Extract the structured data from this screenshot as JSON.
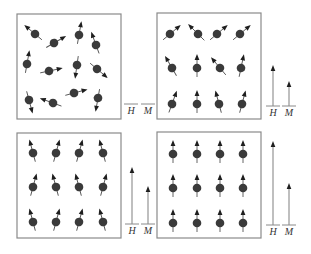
{
  "figure": {
    "colors": {
      "dot": "#3a3a3a",
      "border": "#8a8a8a",
      "arrowhead": "#1e1e1e"
    },
    "panels": [
      {
        "id": "panel-1",
        "box": {
          "x": 17,
          "y": 14,
          "w": 104,
          "h": 105
        },
        "spins": [
          {
            "x": 18,
            "y": 20,
            "angle": -50
          },
          {
            "x": 37,
            "y": 29,
            "angle": 60
          },
          {
            "x": 62,
            "y": 21,
            "angle": 10
          },
          {
            "x": 79,
            "y": 31,
            "angle": -20
          },
          {
            "x": 10,
            "y": 50,
            "angle": 10
          },
          {
            "x": 32,
            "y": 57,
            "angle": 78
          },
          {
            "x": 60,
            "y": 51,
            "angle": 188
          },
          {
            "x": 80,
            "y": 55,
            "angle": 130
          },
          {
            "x": 12,
            "y": 86,
            "angle": 165
          },
          {
            "x": 36,
            "y": 89,
            "angle": -70
          },
          {
            "x": 57,
            "y": 79,
            "angle": 75
          },
          {
            "x": 81,
            "y": 84,
            "angle": 190
          }
        ],
        "indicators": {
          "H": {
            "label": "H",
            "x": 131,
            "length": 0
          },
          "M": {
            "label": "M",
            "x": 148,
            "length": 0
          },
          "baseline_y": 104
        }
      },
      {
        "id": "panel-2",
        "box": {
          "x": 157,
          "y": 13,
          "w": 104,
          "h": 106
        },
        "spins": [
          {
            "x": 13,
            "y": 21,
            "angle": 50
          },
          {
            "x": 41,
            "y": 21,
            "angle": -45
          },
          {
            "x": 60,
            "y": 21,
            "angle": 50
          },
          {
            "x": 83,
            "y": 21,
            "angle": 50
          },
          {
            "x": 15,
            "y": 55,
            "angle": -30
          },
          {
            "x": 40,
            "y": 55,
            "angle": 0
          },
          {
            "x": 63,
            "y": 55,
            "angle": -40
          },
          {
            "x": 84,
            "y": 55,
            "angle": 12
          },
          {
            "x": 15,
            "y": 91,
            "angle": 20
          },
          {
            "x": 40,
            "y": 91,
            "angle": 0
          },
          {
            "x": 62,
            "y": 91,
            "angle": -15
          },
          {
            "x": 85,
            "y": 91,
            "angle": 15
          }
        ],
        "indicators": {
          "H": {
            "label": "H",
            "x": 273,
            "length": 41
          },
          "M": {
            "label": "M",
            "x": 289,
            "length": 25
          },
          "baseline_y": 106
        }
      },
      {
        "id": "panel-3",
        "box": {
          "x": 17,
          "y": 133,
          "w": 104,
          "h": 105
        },
        "spins": [
          {
            "x": 16,
            "y": 20,
            "angle": -15
          },
          {
            "x": 39,
            "y": 20,
            "angle": 15
          },
          {
            "x": 62,
            "y": 20,
            "angle": 15
          },
          {
            "x": 86,
            "y": 20,
            "angle": -15
          },
          {
            "x": 16,
            "y": 54,
            "angle": 15
          },
          {
            "x": 39,
            "y": 54,
            "angle": -15
          },
          {
            "x": 62,
            "y": 54,
            "angle": -15
          },
          {
            "x": 86,
            "y": 54,
            "angle": 15
          },
          {
            "x": 16,
            "y": 89,
            "angle": -15
          },
          {
            "x": 39,
            "y": 89,
            "angle": 15
          },
          {
            "x": 62,
            "y": 89,
            "angle": 15
          },
          {
            "x": 86,
            "y": 89,
            "angle": -15
          }
        ],
        "indicators": {
          "H": {
            "label": "H",
            "x": 132,
            "length": 57
          },
          "M": {
            "label": "M",
            "x": 148,
            "length": 38
          },
          "baseline_y": 224
        }
      },
      {
        "id": "panel-4",
        "box": {
          "x": 157,
          "y": 132,
          "w": 104,
          "h": 106
        },
        "spins": [
          {
            "x": 16,
            "y": 22,
            "angle": 0
          },
          {
            "x": 40,
            "y": 22,
            "angle": 0
          },
          {
            "x": 63,
            "y": 22,
            "angle": 0
          },
          {
            "x": 86,
            "y": 22,
            "angle": 0
          },
          {
            "x": 16,
            "y": 56,
            "angle": 0
          },
          {
            "x": 40,
            "y": 56,
            "angle": 0
          },
          {
            "x": 63,
            "y": 56,
            "angle": 0
          },
          {
            "x": 86,
            "y": 56,
            "angle": 0
          },
          {
            "x": 16,
            "y": 91,
            "angle": 0
          },
          {
            "x": 40,
            "y": 91,
            "angle": 0
          },
          {
            "x": 63,
            "y": 91,
            "angle": 0
          },
          {
            "x": 86,
            "y": 91,
            "angle": 0
          }
        ],
        "indicators": {
          "H": {
            "label": "H",
            "x": 273,
            "length": 84
          },
          "M": {
            "label": "M",
            "x": 289,
            "length": 42
          },
          "baseline_y": 225
        }
      }
    ]
  }
}
